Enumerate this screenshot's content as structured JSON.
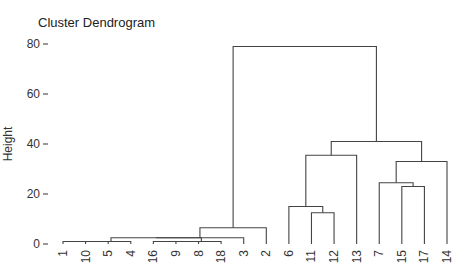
{
  "chart_data": {
    "type": "dendrogram",
    "title": "Cluster Dendrogram",
    "xlabel": "",
    "ylabel": "Height",
    "ylim": [
      0,
      80
    ],
    "yticks": [
      0,
      20,
      40,
      60,
      80
    ],
    "grid": false,
    "leaf_order": [
      "1",
      "10",
      "5",
      "4",
      "16",
      "9",
      "8",
      "18",
      "3",
      "2",
      "6",
      "11",
      "12",
      "13",
      "7",
      "15",
      "17",
      "14"
    ],
    "merges": [
      {
        "left": "leaf:1",
        "right": "leaf:10",
        "height": 1.0,
        "id": "m1"
      },
      {
        "left": "m1",
        "right": "leaf:5",
        "height": 1.0,
        "id": "m2"
      },
      {
        "left": "m2",
        "right": "leaf:4",
        "height": 1.0,
        "id": "m3"
      },
      {
        "left": "leaf:16",
        "right": "leaf:9",
        "height": 1.0,
        "id": "m4"
      },
      {
        "left": "m4",
        "right": "leaf:8",
        "height": 1.0,
        "id": "m5"
      },
      {
        "left": "m5",
        "right": "leaf:18",
        "height": 1.0,
        "id": "m6"
      },
      {
        "left": "m3",
        "right": "m6",
        "height": 2.5,
        "id": "m7"
      },
      {
        "left": "m7",
        "right": "leaf:3",
        "height": 2.5,
        "id": "m8"
      },
      {
        "left": "m8",
        "right": "leaf:2",
        "height": 6.5,
        "id": "m9"
      },
      {
        "left": "leaf:11",
        "right": "leaf:12",
        "height": 12.5,
        "id": "m10"
      },
      {
        "left": "leaf:6",
        "right": "m10",
        "height": 15.0,
        "id": "m11"
      },
      {
        "left": "m11",
        "right": "leaf:13",
        "height": 35.5,
        "id": "m12"
      },
      {
        "left": "leaf:15",
        "right": "leaf:17",
        "height": 23.0,
        "id": "m13"
      },
      {
        "left": "leaf:7",
        "right": "m13",
        "height": 24.5,
        "id": "m14"
      },
      {
        "left": "m14",
        "right": "leaf:14",
        "height": 33.0,
        "id": "m15"
      },
      {
        "left": "m12",
        "right": "m15",
        "height": 41.0,
        "id": "m16"
      },
      {
        "left": "m9",
        "right": "m16",
        "height": 79.0,
        "id": "m17"
      }
    ]
  },
  "labels": {
    "title": "Cluster Dendrogram",
    "ylabel": "Height"
  }
}
